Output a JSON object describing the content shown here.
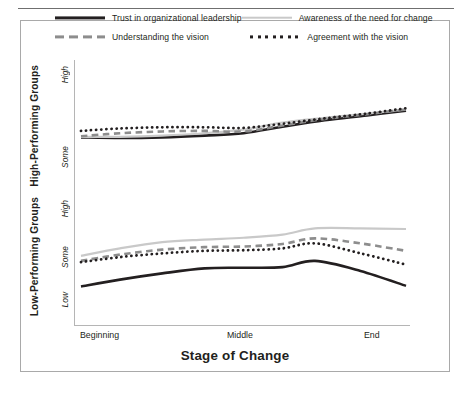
{
  "figure": {
    "x_axis_title": "Stage of Change",
    "x_tick_labels": [
      "Beginning",
      "Middle",
      "End"
    ],
    "panels": [
      {
        "group_label": "High-Performing Groups",
        "y_tick_labels": [
          "High",
          "Some"
        ]
      },
      {
        "group_label": "Low-Performing Groups",
        "y_tick_labels": [
          "High",
          "Some",
          "Low"
        ]
      }
    ]
  },
  "legend": {
    "items": [
      {
        "label": "Trust in organizational leadership",
        "style": "solid-dark",
        "color": "#231f20"
      },
      {
        "label": "Awareness of the need for change",
        "style": "solid-light",
        "color": "#c9c9c9"
      },
      {
        "label": "Understanding the vision",
        "style": "dashed",
        "color": "#8d8d8d"
      },
      {
        "label": "Agreement with the vision",
        "style": "dotted",
        "color": "#231f20"
      }
    ]
  },
  "chart_data": {
    "type": "line",
    "title": "",
    "xlabel": "Stage of Change",
    "ylabel": "",
    "x": [
      "Beginning",
      "Middle",
      "End"
    ],
    "x_numeric": [
      0,
      0.5,
      1
    ],
    "grid": false,
    "legend_position": "top",
    "panels": [
      {
        "name": "High-Performing Groups",
        "ylim": [
          0,
          1
        ],
        "ytick_labels": [
          "Some",
          "High"
        ],
        "ytick_values": [
          0.12,
          0.86
        ],
        "series": [
          {
            "name": "Trust in organizational leadership",
            "style": "solid-dark",
            "color": "#231f20",
            "x": [
              0.0,
              0.12,
              0.25,
              0.38,
              0.5,
              0.62,
              0.75,
              0.88,
              1.0
            ],
            "values": [
              0.4,
              0.395,
              0.4,
              0.415,
              0.435,
              0.49,
              0.545,
              0.585,
              0.625
            ]
          },
          {
            "name": "Awareness of the need for change",
            "style": "solid-light",
            "color": "#c9c9c9",
            "x": [
              0.0,
              0.12,
              0.25,
              0.38,
              0.5,
              0.62,
              0.75,
              0.88,
              1.0
            ],
            "values": [
              0.405,
              0.405,
              0.415,
              0.435,
              0.465,
              0.525,
              0.565,
              0.6,
              0.635
            ]
          },
          {
            "name": "Understanding the vision",
            "style": "dashed",
            "color": "#8d8d8d",
            "x": [
              0.0,
              0.12,
              0.25,
              0.38,
              0.5,
              0.62,
              0.75,
              0.88,
              1.0
            ],
            "values": [
              0.41,
              0.435,
              0.45,
              0.455,
              0.45,
              0.5,
              0.555,
              0.595,
              0.635
            ]
          },
          {
            "name": "Agreement with the vision",
            "style": "dotted",
            "color": "#231f20",
            "x": [
              0.0,
              0.12,
              0.25,
              0.38,
              0.5,
              0.62,
              0.75,
              0.88,
              1.0
            ],
            "values": [
              0.455,
              0.475,
              0.485,
              0.485,
              0.48,
              0.515,
              0.56,
              0.6,
              0.645
            ]
          }
        ]
      },
      {
        "name": "Low-Performing Groups",
        "ylim": [
          0,
          1
        ],
        "ytick_labels": [
          "Low",
          "Some",
          "High"
        ],
        "ytick_values": [
          0.14,
          0.47,
          0.8
        ],
        "series": [
          {
            "name": "Trust in organizational leadership",
            "style": "solid-dark",
            "color": "#231f20",
            "x": [
              0.0,
              0.12,
              0.25,
              0.38,
              0.5,
              0.62,
              0.72,
              0.86,
              1.0
            ],
            "values": [
              0.26,
              0.315,
              0.365,
              0.405,
              0.41,
              0.415,
              0.465,
              0.385,
              0.265
            ]
          },
          {
            "name": "Awareness of the need for change",
            "style": "solid-light",
            "color": "#c9c9c9",
            "x": [
              0.0,
              0.12,
              0.25,
              0.38,
              0.5,
              0.62,
              0.72,
              0.86,
              1.0
            ],
            "values": [
              0.505,
              0.565,
              0.615,
              0.635,
              0.65,
              0.675,
              0.725,
              0.725,
              0.72
            ]
          },
          {
            "name": "Understanding the vision",
            "style": "dashed",
            "color": "#8d8d8d",
            "x": [
              0.0,
              0.12,
              0.25,
              0.38,
              0.5,
              0.62,
              0.72,
              0.86,
              1.0
            ],
            "values": [
              0.465,
              0.515,
              0.555,
              0.575,
              0.58,
              0.6,
              0.645,
              0.605,
              0.545
            ]
          },
          {
            "name": "Agreement with the vision",
            "style": "dotted",
            "color": "#231f20",
            "x": [
              0.0,
              0.12,
              0.25,
              0.38,
              0.5,
              0.62,
              0.72,
              0.86,
              1.0
            ],
            "values": [
              0.455,
              0.495,
              0.525,
              0.545,
              0.55,
              0.565,
              0.605,
              0.525,
              0.435
            ]
          }
        ]
      }
    ]
  }
}
